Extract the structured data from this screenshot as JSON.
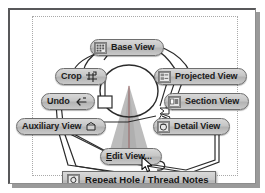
{
  "window": {
    "title": "Drawing View Marking Menu"
  },
  "canvas": {
    "description": "Engineering drawing sheet with circular part view and conical section",
    "shapes": [
      {
        "name": "center-circle",
        "type": "circle"
      },
      {
        "name": "cone-projection",
        "type": "triangle"
      },
      {
        "name": "sheet-boundary",
        "type": "dotted-rectangle"
      }
    ]
  },
  "menu": {
    "name": "drawing-views-marking-menu",
    "buttons": [
      {
        "id": "base-view",
        "label": "Base View",
        "accelerator": "",
        "icon": "base-view-icon",
        "icon_position": "left",
        "shape": "pill"
      },
      {
        "id": "crop",
        "label": "Crop",
        "accelerator": "",
        "icon": "crop-icon",
        "icon_position": "right",
        "shape": "pill"
      },
      {
        "id": "projected-view",
        "label": "Projected View",
        "accelerator": "",
        "icon": "projected-view-icon",
        "icon_position": "left",
        "shape": "pill"
      },
      {
        "id": "undo",
        "label": "Undo",
        "accelerator": "",
        "icon": "undo-arrow-icon",
        "icon_position": "right",
        "shape": "pill"
      },
      {
        "id": "section-view",
        "label": "Section View",
        "accelerator": "",
        "icon": "section-view-icon",
        "icon_position": "left",
        "shape": "pill"
      },
      {
        "id": "auxiliary-view",
        "label": "Auxiliary View",
        "accelerator": "",
        "icon": "auxiliary-view-icon",
        "icon_position": "right",
        "shape": "pill"
      },
      {
        "id": "detail-view",
        "label": "Detail View",
        "accelerator": "",
        "icon": "detail-view-icon",
        "icon_position": "left",
        "shape": "pill"
      },
      {
        "id": "edit-view",
        "label": "Edit View...",
        "accelerator": "E",
        "icon": "",
        "icon_position": "none",
        "shape": "pill",
        "state": "hovered"
      },
      {
        "id": "repeat-hole-thread-notes",
        "label": "Repeat Hole / Thread Notes",
        "accelerator": "R",
        "icon": "repeat-icon",
        "icon_position": "left",
        "shape": "bar"
      }
    ]
  },
  "cursor": {
    "name": "mouse-pointer",
    "over": "edit-view"
  },
  "colors": {
    "button_face": "#c6c6c6",
    "button_border": "#6e6e6e",
    "text": "#1b1b1b",
    "canvas": "#ffffff",
    "window_border": "#58585a",
    "shadow": "#9a9a9a",
    "geometry_stroke": "#2b2b2b",
    "cone_fill": "#b9b9b9"
  }
}
